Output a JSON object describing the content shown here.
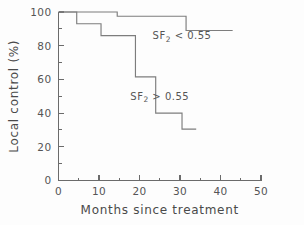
{
  "chart_data": {
    "type": "line",
    "subtype": "kaplan-meier-step",
    "title": "",
    "xlabel": "Months since treatment",
    "ylabel": "Local control (%)",
    "xlim": [
      0,
      50
    ],
    "ylim": [
      0,
      100
    ],
    "xticks": [
      0,
      10,
      20,
      30,
      40,
      50
    ],
    "xtick_labels": [
      "0",
      "10",
      "20",
      "30",
      "40",
      "50"
    ],
    "xticks_minor": [
      5,
      15,
      25,
      35,
      45
    ],
    "yticks": [
      0,
      20,
      40,
      60,
      80,
      100
    ],
    "ytick_labels": [
      "0",
      "20",
      "40",
      "60",
      "80",
      "100"
    ],
    "yticks_minor": [
      10,
      30,
      50,
      70,
      90
    ],
    "grid": false,
    "legend_position": "inline-annotation",
    "series": [
      {
        "name": "SF2 < 0.55",
        "label": "SF",
        "label_sub": "2",
        "label_tail": " < 0.55",
        "label_x": 30.5,
        "label_y": 84,
        "color": "#7d7d7d",
        "points": [
          {
            "x": 0.0,
            "y": 100
          },
          {
            "x": 14.5,
            "y": 100
          },
          {
            "x": 14.5,
            "y": 97.5
          },
          {
            "x": 31.5,
            "y": 97.5
          },
          {
            "x": 31.5,
            "y": 89
          },
          {
            "x": 43.0,
            "y": 89
          }
        ]
      },
      {
        "name": "SF2 > 0.55",
        "label": "SF",
        "label_sub": "2",
        "label_tail": " > 0.55",
        "label_x": 25.0,
        "label_y": 48,
        "color": "#7d7d7d",
        "points": [
          {
            "x": 0.0,
            "y": 100
          },
          {
            "x": 4.5,
            "y": 100
          },
          {
            "x": 4.5,
            "y": 93
          },
          {
            "x": 10.5,
            "y": 93
          },
          {
            "x": 10.5,
            "y": 86
          },
          {
            "x": 19.0,
            "y": 86
          },
          {
            "x": 19.0,
            "y": 61.5
          },
          {
            "x": 24.0,
            "y": 61.5
          },
          {
            "x": 24.0,
            "y": 40
          },
          {
            "x": 30.5,
            "y": 40
          },
          {
            "x": 30.5,
            "y": 30.5
          },
          {
            "x": 34.0,
            "y": 30.5
          }
        ]
      }
    ]
  },
  "axes": {
    "x_title": "Months since treatment",
    "y_title": "Local control (%)"
  }
}
